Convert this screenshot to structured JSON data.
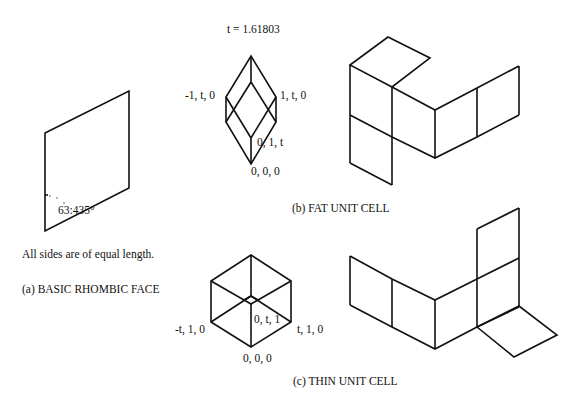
{
  "panel_a": {
    "angle_label": "63:435°",
    "note": "All sides are of equal length.",
    "caption": "(a) BASIC RHOMBIC FACE"
  },
  "panel_b": {
    "constant": "t = 1.61803",
    "vertex_left": "-1, t, 0",
    "vertex_right": "1, t, 0",
    "vertex_inner": "0, 1, t",
    "vertex_origin": "0, 0, 0",
    "caption": "(b) FAT UNIT CELL"
  },
  "panel_c": {
    "vertex_left": "-t, 1, 0",
    "vertex_right": "t, 1, 0",
    "vertex_inner": "0, t, 1",
    "vertex_origin": "0, 0, 0",
    "caption": "(c) THIN UNIT CELL"
  }
}
